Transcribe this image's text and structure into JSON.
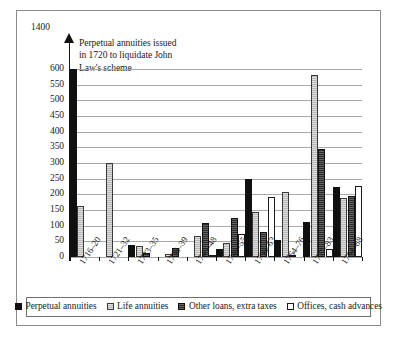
{
  "chart_data": {
    "type": "bar",
    "title": "",
    "subtitle": "",
    "xlabel": "",
    "ylabel": "",
    "ylim": [
      0,
      600
    ],
    "y_axis_top_label": "1400",
    "grid": true,
    "legend_position": "bottom",
    "yticks": [
      600,
      550,
      500,
      450,
      400,
      350,
      300,
      250,
      200,
      150,
      100,
      50,
      0
    ],
    "categories": [
      "1716–20",
      "1721–32",
      "1733–35",
      "1736–39",
      "1740–48",
      "1749–55",
      "1756–63",
      "1764–76",
      "1777–83",
      "1784–88"
    ],
    "series": [
      {
        "name": "Perpetual annuities",
        "swatch": "black-solid",
        "color": "#101010",
        "values": [
          1400,
          0,
          39,
          0,
          0,
          27,
          249,
          54,
          112,
          222
        ]
      },
      {
        "name": "Life annuities",
        "swatch": "light-gray-hatched",
        "color": "#b8b8b8",
        "values": [
          163,
          299,
          34,
          10,
          66,
          45,
          145,
          208,
          581,
          189
        ]
      },
      {
        "name": "Other loans, extra taxes",
        "swatch": "dark-solid",
        "color": "#2a2a2a",
        "values": [
          0,
          0,
          12,
          28,
          107,
          125,
          79,
          4,
          345,
          194
        ]
      },
      {
        "name": "Offices, cash advances",
        "swatch": "white-outline",
        "color": "#ffffff",
        "values": [
          0,
          0,
          0,
          0,
          5,
          73,
          192,
          0,
          27,
          227
        ]
      }
    ],
    "annotations": [
      {
        "id": "law-scheme-note",
        "text": "Perpetual annuities issued in 1720 to liquidate John Law's scheme",
        "lines": [
          "Perpetual annuities issued",
          "in 1720 to liquidate John",
          "Law's scheme"
        ],
        "target_category": "1716–20",
        "target_series": "Perpetual annuities"
      }
    ]
  },
  "axes": {
    "y_top_marker": "1400"
  }
}
